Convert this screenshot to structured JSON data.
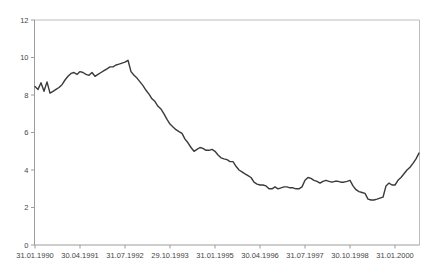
{
  "chart_data": {
    "type": "line",
    "title": "",
    "xlabel": "",
    "ylabel": "",
    "grid": false,
    "legend": false,
    "ylim": [
      0,
      12
    ],
    "y_ticks": [
      0,
      2,
      4,
      6,
      8,
      10,
      12
    ],
    "x_tick_labels": [
      "31.01.1990",
      "30.04.1991",
      "31.07.1992",
      "29.10.1993",
      "31.01.1995",
      "30.04.1996",
      "31.07.1997",
      "30.10.1998",
      "31.01.2000"
    ],
    "points_per_tick_interval": 15,
    "values": [
      8.45,
      8.3,
      8.65,
      8.2,
      8.7,
      8.1,
      8.2,
      8.3,
      8.4,
      8.55,
      8.8,
      9.0,
      9.15,
      9.2,
      9.1,
      9.25,
      9.2,
      9.1,
      9.05,
      9.2,
      9.0,
      9.1,
      9.2,
      9.3,
      9.4,
      9.5,
      9.5,
      9.6,
      9.65,
      9.7,
      9.75,
      9.85,
      9.25,
      9.05,
      8.9,
      8.7,
      8.5,
      8.25,
      8.05,
      7.8,
      7.65,
      7.4,
      7.25,
      7.0,
      6.7,
      6.45,
      6.3,
      6.15,
      6.05,
      5.95,
      5.65,
      5.45,
      5.2,
      5.0,
      5.1,
      5.2,
      5.15,
      5.05,
      5.05,
      5.1,
      5.0,
      4.8,
      4.65,
      4.6,
      4.55,
      4.45,
      4.45,
      4.2,
      4.0,
      3.9,
      3.8,
      3.7,
      3.6,
      3.35,
      3.25,
      3.2,
      3.2,
      3.15,
      3.0,
      3.0,
      3.1,
      3.0,
      3.05,
      3.1,
      3.1,
      3.05,
      3.05,
      3.0,
      3.0,
      3.1,
      3.45,
      3.6,
      3.55,
      3.45,
      3.4,
      3.3,
      3.4,
      3.45,
      3.4,
      3.35,
      3.4,
      3.4,
      3.35,
      3.35,
      3.4,
      3.45,
      3.15,
      2.95,
      2.85,
      2.8,
      2.75,
      2.45,
      2.4,
      2.4,
      2.45,
      2.5,
      2.55,
      3.15,
      3.3,
      3.2,
      3.2,
      3.45,
      3.6,
      3.8,
      4.0,
      4.15,
      4.35,
      4.6,
      4.9
    ]
  },
  "colors": {
    "line": "#3a3a3a",
    "axis": "#9c9c9c",
    "border": "#bdbdbd",
    "label": "#454545",
    "background": "#ffffff"
  }
}
